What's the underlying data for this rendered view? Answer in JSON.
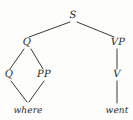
{
  "figure": {
    "kind": "syntax-tree-diagram",
    "background_color": "#fdfdfc",
    "line_color": "#3a3a3a",
    "text_color": "#2b2b2b",
    "width": 133,
    "height": 120
  },
  "nodes": {
    "s": {
      "label": "S",
      "x": 73,
      "y": 16,
      "type": "nonterminal"
    },
    "q_upper": {
      "label": "Q",
      "x": 27,
      "y": 43,
      "type": "nonterminal"
    },
    "vp": {
      "label": "VP",
      "x": 118,
      "y": 43,
      "type": "nonterminal"
    },
    "q_lower": {
      "label": "Q",
      "x": 9,
      "y": 75,
      "type": "nonterminal"
    },
    "pp": {
      "label": "PP",
      "x": 44,
      "y": 75,
      "type": "nonterminal"
    },
    "v": {
      "label": "V",
      "x": 117,
      "y": 75,
      "type": "nonterminal"
    },
    "where": {
      "label": "where",
      "x": 28,
      "y": 111,
      "type": "terminal"
    },
    "went": {
      "label": "went",
      "x": 117,
      "y": 111,
      "type": "terminal"
    }
  },
  "edges": [
    {
      "name": "s-to-q",
      "from": "S",
      "to": "Q",
      "x1": 70,
      "y1": 22,
      "x2": 29,
      "y2": 37
    },
    {
      "name": "s-to-vp",
      "from": "S",
      "to": "VP",
      "x1": 77,
      "y1": 22,
      "x2": 114,
      "y2": 37
    },
    {
      "name": "q-to-q",
      "from": "Q",
      "to": "Q",
      "x1": 24,
      "y1": 49,
      "x2": 10,
      "y2": 69
    },
    {
      "name": "q-to-pp",
      "from": "Q",
      "to": "PP",
      "x1": 31,
      "y1": 49,
      "x2": 43,
      "y2": 69
    },
    {
      "name": "q-to-where",
      "from": "Q",
      "to": "where",
      "x1": 11,
      "y1": 81,
      "x2": 27,
      "y2": 102
    },
    {
      "name": "pp-to-where",
      "from": "PP",
      "to": "where",
      "x1": 44,
      "y1": 81,
      "x2": 29,
      "y2": 102
    },
    {
      "name": "vp-to-v",
      "from": "VP",
      "to": "V",
      "x1": 117,
      "y1": 49,
      "x2": 117,
      "y2": 69
    },
    {
      "name": "v-to-went",
      "from": "V",
      "to": "went",
      "x1": 117,
      "y1": 81,
      "x2": 117,
      "y2": 103
    }
  ]
}
